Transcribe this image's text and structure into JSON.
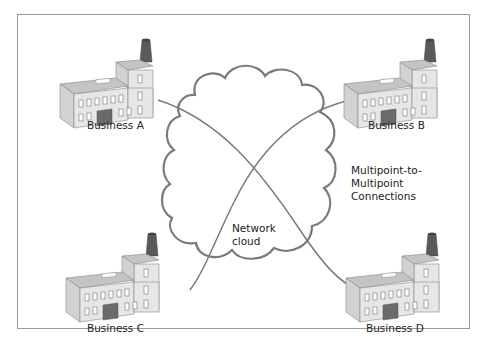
{
  "diagram": {
    "nodes": [
      {
        "id": "A",
        "label": "Business A",
        "icon": "factory-icon"
      },
      {
        "id": "B",
        "label": "Business B",
        "icon": "factory-icon"
      },
      {
        "id": "C",
        "label": "Business C",
        "icon": "factory-icon"
      },
      {
        "id": "D",
        "label": "Business D",
        "icon": "factory-icon"
      }
    ],
    "cloud": {
      "label_line1": "Network",
      "label_line2": "cloud",
      "icon": "cloud-icon"
    },
    "connections_label": {
      "line1": "Multipoint-to-",
      "line2": "Multipoint",
      "line3": "Connections"
    },
    "edges": [
      {
        "from": "A",
        "to": "D"
      },
      {
        "from": "B",
        "to": "C"
      }
    ],
    "colors": {
      "line": "#7a7a7a",
      "building_front": "#e6e6e6",
      "building_side": "#d2d2d2",
      "building_roof": "#c4c4c4",
      "chimney": "#5a5a5a",
      "door": "#6a6a6a",
      "border": "#9a9a9a"
    }
  }
}
